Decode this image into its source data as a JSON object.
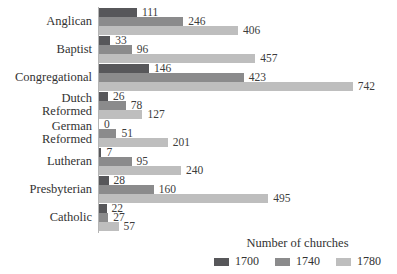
{
  "chart_data": {
    "type": "bar",
    "orientation": "horizontal",
    "categories": [
      "Anglican",
      "Baptist",
      "Congregational",
      "Dutch\nReformed",
      "German\nReformed",
      "Lutheran",
      "Presbyterian",
      "Catholic"
    ],
    "series": [
      {
        "name": "1700",
        "color": "#57575a",
        "values": [
          111,
          33,
          146,
          26,
          0,
          7,
          28,
          22
        ]
      },
      {
        "name": "1740",
        "color": "#8b8b8c",
        "values": [
          246,
          96,
          423,
          78,
          51,
          95,
          160,
          27
        ]
      },
      {
        "name": "1780",
        "color": "#bebebe",
        "values": [
          406,
          457,
          742,
          127,
          201,
          240,
          495,
          57
        ]
      }
    ],
    "legend_title": "Number of churches",
    "xlim": [
      0,
      760
    ],
    "grid": "off",
    "legend_position": "bottom-right",
    "axis_color": "#b5b5b5"
  }
}
